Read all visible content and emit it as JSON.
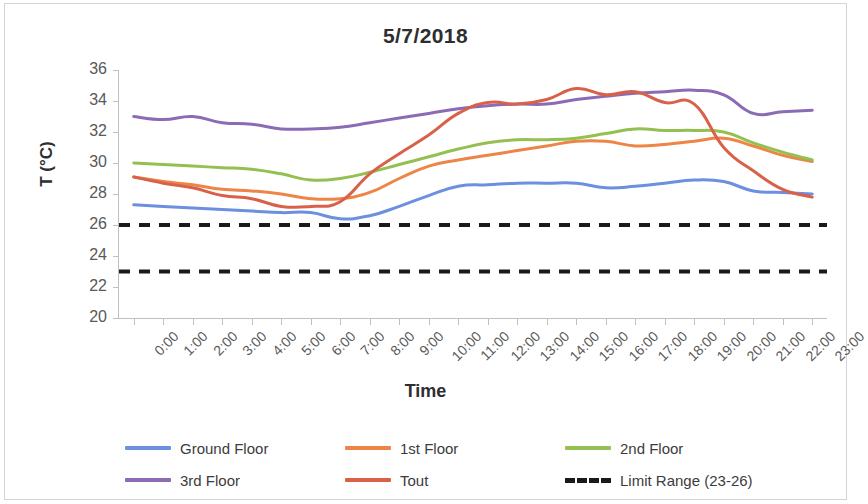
{
  "chart_data": {
    "type": "line",
    "title": "5/7/2018",
    "xlabel": "Time",
    "ylabel": "T (°C)",
    "ylim": [
      20,
      36
    ],
    "ytick_step": 2,
    "yticks": [
      36,
      34,
      32,
      30,
      28,
      26,
      24,
      22,
      20
    ],
    "grid": false,
    "legend_position": "bottom",
    "x": [
      "0:00",
      "1:00",
      "2:00",
      "3:00",
      "4:00",
      "5:00",
      "6:00",
      "7:00",
      "8:00",
      "9:00",
      "10:00",
      "11:00",
      "12:00",
      "13:00",
      "14:00",
      "15:00",
      "16:00",
      "17:00",
      "18:00",
      "19:00",
      "20:00",
      "21:00",
      "22:00",
      "23:00"
    ],
    "categories": [
      "0:00",
      "1:00",
      "2:00",
      "3:00",
      "4:00",
      "5:00",
      "6:00",
      "7:00",
      "8:00",
      "9:00",
      "10:00",
      "11:00",
      "12:00",
      "13:00",
      "14:00",
      "15:00",
      "16:00",
      "17:00",
      "18:00",
      "19:00",
      "20:00",
      "21:00",
      "22:00",
      "23:00"
    ],
    "series": [
      {
        "name": "Ground Floor",
        "color": "#6C8FE0",
        "style": "solid",
        "values": [
          27.3,
          27.2,
          27.1,
          27.0,
          26.9,
          26.8,
          26.8,
          26.4,
          26.6,
          27.2,
          27.9,
          28.5,
          28.6,
          28.7,
          28.7,
          28.7,
          28.4,
          28.5,
          28.7,
          28.9,
          28.8,
          28.2,
          28.1,
          28.0
        ]
      },
      {
        "name": "1st Floor",
        "color": "#ED8546",
        "style": "solid",
        "values": [
          29.1,
          28.8,
          28.6,
          28.3,
          28.2,
          28.0,
          27.7,
          27.7,
          28.1,
          29.0,
          29.8,
          30.2,
          30.5,
          30.8,
          31.1,
          31.4,
          31.4,
          31.1,
          31.2,
          31.4,
          31.6,
          31.1,
          30.5,
          30.1
        ]
      },
      {
        "name": "2nd Floor",
        "color": "#93C051",
        "style": "solid",
        "values": [
          30.0,
          29.9,
          29.8,
          29.7,
          29.6,
          29.3,
          28.9,
          29.0,
          29.4,
          29.9,
          30.4,
          30.9,
          31.3,
          31.5,
          31.5,
          31.6,
          31.9,
          32.2,
          32.1,
          32.1,
          32.0,
          31.3,
          30.7,
          30.2
        ]
      },
      {
        "name": "3rd Floor",
        "color": "#8B6BB5",
        "style": "solid",
        "values": [
          33.0,
          32.8,
          33.0,
          32.6,
          32.5,
          32.2,
          32.2,
          32.3,
          32.6,
          32.9,
          33.2,
          33.5,
          33.7,
          33.8,
          33.8,
          34.1,
          34.3,
          34.5,
          34.6,
          34.7,
          34.4,
          33.2,
          33.3,
          33.4
        ]
      },
      {
        "name": "Tout",
        "color": "#D9614A",
        "style": "solid",
        "values": [
          29.1,
          28.7,
          28.4,
          27.9,
          27.7,
          27.2,
          27.2,
          27.5,
          29.3,
          30.6,
          31.8,
          33.2,
          33.9,
          33.8,
          34.1,
          34.8,
          34.4,
          34.6,
          33.9,
          33.8,
          31.0,
          29.5,
          28.3,
          27.8
        ]
      }
    ],
    "limits": {
      "name": "Limit Range (23-26)",
      "color": "#1a1a1a",
      "style": "dashed",
      "upper": 26,
      "lower": 23
    }
  },
  "legend": {
    "items": [
      {
        "label": "Ground Floor",
        "color": "#6C8FE0",
        "style": "solid"
      },
      {
        "label": "1st Floor",
        "color": "#ED8546",
        "style": "solid"
      },
      {
        "label": "2nd Floor",
        "color": "#93C051",
        "style": "solid"
      },
      {
        "label": "3rd Floor",
        "color": "#8B6BB5",
        "style": "solid"
      },
      {
        "label": "Tout",
        "color": "#D9614A",
        "style": "solid"
      },
      {
        "label": "Limit Range (23-26)",
        "color": "#1a1a1a",
        "style": "dashed"
      }
    ]
  }
}
